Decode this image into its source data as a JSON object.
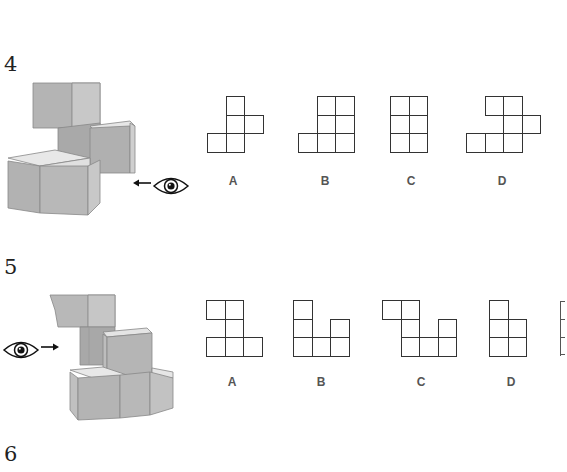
{
  "problems": [
    {
      "number": "4",
      "view_direction": "from right, looking left",
      "options": [
        {
          "label": "A",
          "cells": [
            [
              0,
              1
            ],
            [
              1,
              1
            ],
            [
              1,
              2
            ],
            [
              2,
              0
            ],
            [
              2,
              1
            ]
          ]
        },
        {
          "label": "B",
          "cells": [
            [
              0,
              1
            ],
            [
              0,
              2
            ],
            [
              1,
              1
            ],
            [
              1,
              2
            ],
            [
              2,
              0
            ],
            [
              2,
              1
            ],
            [
              2,
              2
            ]
          ]
        },
        {
          "label": "C",
          "cells": [
            [
              0,
              0
            ],
            [
              0,
              1
            ],
            [
              1,
              0
            ],
            [
              1,
              1
            ],
            [
              2,
              0
            ],
            [
              2,
              1
            ]
          ]
        },
        {
          "label": "D",
          "cells": [
            [
              0,
              1
            ],
            [
              0,
              2
            ],
            [
              1,
              2
            ],
            [
              1,
              3
            ],
            [
              2,
              0
            ],
            [
              2,
              1
            ],
            [
              2,
              2
            ]
          ]
        }
      ]
    },
    {
      "number": "5",
      "view_direction": "from left, looking right",
      "options": [
        {
          "label": "A",
          "cells": [
            [
              0,
              0
            ],
            [
              0,
              1
            ],
            [
              1,
              1
            ],
            [
              2,
              0
            ],
            [
              2,
              1
            ],
            [
              2,
              2
            ]
          ]
        },
        {
          "label": "B",
          "cells": [
            [
              0,
              0
            ],
            [
              1,
              0
            ],
            [
              1,
              2
            ],
            [
              2,
              0
            ],
            [
              2,
              1
            ],
            [
              2,
              2
            ]
          ]
        },
        {
          "label": "C",
          "cells": [
            [
              0,
              0
            ],
            [
              0,
              1
            ],
            [
              1,
              1
            ],
            [
              1,
              3
            ],
            [
              2,
              1
            ],
            [
              2,
              2
            ],
            [
              2,
              3
            ]
          ]
        },
        {
          "label": "D",
          "cells": [
            [
              0,
              0
            ],
            [
              1,
              0
            ],
            [
              1,
              1
            ],
            [
              2,
              0
            ],
            [
              2,
              1
            ]
          ]
        }
      ]
    },
    {
      "number": "6"
    }
  ]
}
